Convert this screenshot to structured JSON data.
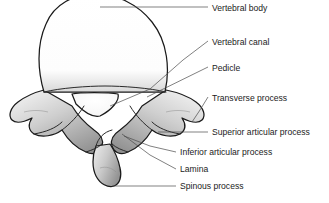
{
  "figure": {
    "background_color": "#ffffff",
    "text_color": "#1b1b1b",
    "leader_color": "#4a4a4a",
    "outline_color": "#1a1a1a",
    "bone_fill_light": "#fbfbfb",
    "bone_fill_mid": "#d2d2d2",
    "bone_fill_dark": "#9a9a9a"
  },
  "labels": [
    {
      "id": "vertebral-body",
      "text": "Vertebral body",
      "text_x": 212,
      "text_y": 11,
      "leader": "M100,7 L208,7"
    },
    {
      "id": "vertebral-canal",
      "text": "Vertebral canal",
      "text_x": 212,
      "text_y": 45,
      "leader": "M110,106 L150,89 L183,60 L208,41"
    },
    {
      "id": "pedicle",
      "text": "Pedicle",
      "text_x": 212,
      "text_y": 71,
      "leader": "M147,97 L208,67"
    },
    {
      "id": "transverse-process",
      "text": "Transverse process",
      "text_x": 212,
      "text_y": 101,
      "leader": "M192,122 L200,110 L208,97"
    },
    {
      "id": "superior-articular-process",
      "text": "Superior articular process",
      "text_x": 212,
      "text_y": 135,
      "leader": "M158,132 L208,132"
    },
    {
      "id": "inferior-articular-process",
      "text": "Inferior articular process",
      "text_x": 180,
      "text_y": 155,
      "leader": "M124,136 L150,146 L176,152"
    },
    {
      "id": "lamina",
      "text": "Lamina",
      "text_x": 180,
      "text_y": 172,
      "leader": "M122,134 L150,155 L176,169"
    },
    {
      "id": "spinous-process",
      "text": "Spinous process",
      "text_x": 180,
      "text_y": 189,
      "leader": "M112,186 L176,186"
    }
  ],
  "anatomy": {
    "vertebral_body": "M165,92 C170,70 168,42 152,22 C138,4 116,-6 96,-6 C74,-6 54,4 46,24 C36,46 38,72 44,92 Z",
    "vertebral_canal": "M72,94 C80,92 108,92 118,94 C120,100 112,110 100,116 C92,118 84,112 76,104 Z",
    "arch_left": "M44,90 C36,92 26,96 18,102 C10,108 8,116 12,120 C16,124 24,122 32,118 C28,124 28,130 34,134 C42,138 54,136 62,130 C68,140 76,148 86,152 C94,156 100,152 102,146 C104,140 100,134 94,130 C86,124 78,116 72,106 Z",
    "arch_right": "M166,90 C176,92 188,96 196,102 C204,108 206,116 202,120 C198,124 190,122 182,118 C186,124 186,130 180,134 C172,138 160,136 152,130 C146,140 138,148 128,152 C120,156 114,152 112,146 C110,140 114,134 120,130 C128,124 136,116 142,106 Z",
    "spinous_process": "M96,146 C92,156 92,168 96,176 C100,184 108,188 114,186 C120,184 122,176 120,168 C118,158 114,150 110,144 Z"
  }
}
